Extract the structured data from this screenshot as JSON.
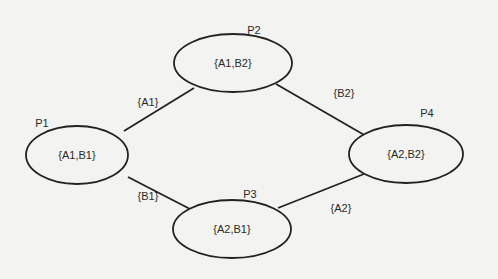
{
  "diagram": {
    "nodes": [
      {
        "id": "P1",
        "label": "P1",
        "set": "{A1,B1}",
        "cx": 77,
        "cy": 155,
        "rx": 51,
        "ry": 29,
        "lx": 42,
        "ly": 127
      },
      {
        "id": "P2",
        "label": "P2",
        "set": "{A1,B2}",
        "cx": 233,
        "cy": 63,
        "rx": 59,
        "ry": 29,
        "lx": 254,
        "ly": 34
      },
      {
        "id": "P3",
        "label": "P3",
        "set": "{A2,B1}",
        "cx": 232,
        "cy": 229,
        "rx": 59,
        "ry": 29,
        "lx": 250,
        "ly": 198
      },
      {
        "id": "P4",
        "label": "P4",
        "set": "{A2,B2}",
        "cx": 406,
        "cy": 154,
        "rx": 57,
        "ry": 29,
        "lx": 427,
        "ly": 117
      }
    ],
    "edges": [
      {
        "from": "P1",
        "to": "P2",
        "label": "{A1}",
        "x1": 124,
        "y1": 131,
        "x2": 194,
        "y2": 88,
        "lx": 148,
        "ly": 106
      },
      {
        "from": "P1",
        "to": "P3",
        "label": "{B1}",
        "x1": 128,
        "y1": 177,
        "x2": 190,
        "y2": 209,
        "lx": 148,
        "ly": 200
      },
      {
        "from": "P2",
        "to": "P4",
        "label": "{B2}",
        "x1": 276,
        "y1": 84,
        "x2": 366,
        "y2": 136,
        "lx": 344,
        "ly": 97
      },
      {
        "from": "P3",
        "to": "P4",
        "label": "{A2}",
        "x1": 278,
        "y1": 208,
        "x2": 364,
        "y2": 174,
        "lx": 341,
        "ly": 212
      }
    ]
  }
}
